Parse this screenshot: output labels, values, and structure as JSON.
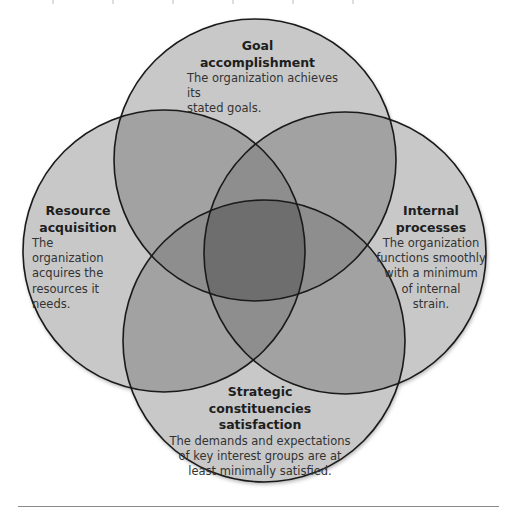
{
  "diagram": {
    "type": "venn",
    "colors": {
      "single": "#c8c8c8",
      "double": "#a2a2a2",
      "triple": "#8e8e8e",
      "quad": "#6e6e6e",
      "stroke": "#1a1a1a",
      "rule": "#8a8a8a"
    },
    "circles": [
      {
        "id": "goal",
        "title_line1": "Goal",
        "title_line2": "accomplishment",
        "desc_line1": "The organization achieves its",
        "desc_line2": "stated goals."
      },
      {
        "id": "resource",
        "title_line1": "Resource",
        "title_line2": "acquisition",
        "desc_line1": "The organization",
        "desc_line2": "acquires the",
        "desc_line3": "resources it",
        "desc_line4": "needs."
      },
      {
        "id": "internal",
        "title_line1": "Internal",
        "title_line2": "processes",
        "desc_line1": "The organization",
        "desc_line2": "functions smoothly",
        "desc_line3": "with a minimum",
        "desc_line4": "of internal",
        "desc_line5": "strain."
      },
      {
        "id": "strategic",
        "title_line1": "Strategic",
        "title_line2": "constituencies",
        "title_line3": "satisfaction",
        "desc_line1": "The demands and expectations",
        "desc_line2": "of key interest groups are at",
        "desc_line3": "least minimally satisfied."
      }
    ]
  }
}
